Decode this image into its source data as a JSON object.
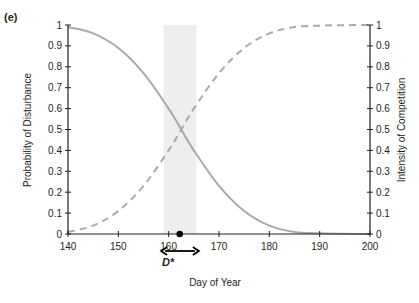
{
  "panel_label": "(e)",
  "chart_data": {
    "type": "line",
    "title": "",
    "xlabel": "Day of Year",
    "ylabel_left": "Probability of Disturbance",
    "ylabel_right": "Intensity of Competition",
    "xlim": [
      140,
      200
    ],
    "ylim": [
      0,
      1
    ],
    "x_ticks": [
      140,
      150,
      160,
      170,
      180,
      190,
      200
    ],
    "y_ticks": [
      0,
      0.1,
      0.2,
      0.3,
      0.4,
      0.5,
      0.6,
      0.7,
      0.8,
      0.9,
      1
    ],
    "y_tick_labels": [
      "0",
      "0.1",
      "0.2",
      "0.3",
      "0.4",
      "0.5",
      "0.6",
      "0.7",
      "0.8",
      "0.9",
      "1"
    ],
    "grid": false,
    "x": [
      140,
      145,
      150,
      155,
      160,
      162.5,
      165,
      170,
      175,
      180,
      185,
      190,
      195,
      200
    ],
    "series": [
      {
        "name": "Probability of Disturbance",
        "axis": "left",
        "style": "solid",
        "color": "#a7a9ac",
        "values": [
          0.99,
          0.96,
          0.89,
          0.77,
          0.6,
          0.5,
          0.4,
          0.23,
          0.11,
          0.04,
          0.01,
          0.003,
          0.001,
          0.0
        ]
      },
      {
        "name": "Intensity of Competition",
        "axis": "right",
        "style": "dashed",
        "color": "#a7a9ac",
        "values": [
          0.01,
          0.04,
          0.11,
          0.23,
          0.4,
          0.5,
          0.6,
          0.77,
          0.89,
          0.96,
          0.99,
          0.997,
          0.999,
          1.0
        ]
      }
    ],
    "annotations": {
      "shaded_band": {
        "x_start": 159,
        "x_end": 165.5,
        "color": "#eeeeee"
      },
      "optimum_point": {
        "x": 162.2,
        "y": 0,
        "label": "D*"
      },
      "double_arrow": {
        "x_start": 158.5,
        "x_end": 166
      }
    }
  }
}
